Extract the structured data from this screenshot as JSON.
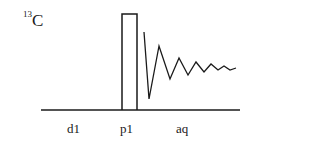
{
  "diagram": {
    "nucleus": {
      "mass_number": "13",
      "symbol": "C"
    },
    "labels": [
      {
        "id": "d1",
        "text": "d1",
        "x": 67
      },
      {
        "id": "p1",
        "text": "p1",
        "x": 120
      },
      {
        "id": "aq",
        "text": "aq",
        "x": 176
      }
    ],
    "baseline": {
      "x1": 41,
      "x2": 240,
      "y": 110
    },
    "pulse": {
      "x1": 122,
      "x2": 137,
      "top": 14,
      "bottom": 110
    },
    "fid_points": "144,32 149,99 159,46 170,79 179,58 188,75 196,62 204,72 211,64 218,70 224,66 230,70 236,68",
    "colors": {
      "stroke": "#1a1a1a",
      "background": "#ffffff"
    }
  }
}
